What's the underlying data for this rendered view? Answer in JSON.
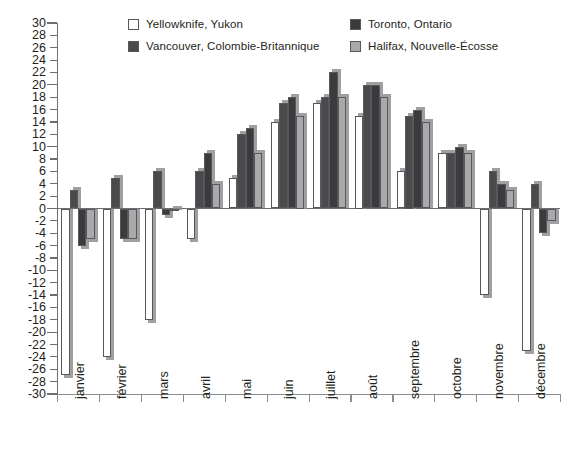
{
  "chart_data": {
    "type": "bar",
    "title": "",
    "subtitle": "",
    "xlabel": "",
    "ylabel": "",
    "ylim": [
      -30,
      30
    ],
    "ytick_step": 2,
    "grid": false,
    "legend_position": "top",
    "categories": [
      "janvier",
      "février",
      "mars",
      "avril",
      "mai",
      "juin",
      "juillet",
      "août",
      "septembre",
      "octobre",
      "novembre",
      "décembre"
    ],
    "ytick_labels": [
      "30",
      "28",
      "26",
      "24",
      "22",
      "20",
      "18",
      "16",
      "14",
      "12",
      "10",
      "8",
      "6",
      "4",
      "2",
      "0",
      "-2",
      "-4",
      "-6",
      "-8",
      "-10",
      "-12",
      "-14",
      "-16",
      "-18",
      "-20",
      "-22",
      "-24",
      "-26",
      "-28",
      "-30"
    ],
    "series": [
      {
        "name": "Yellowknife, Yukon",
        "color": "#ffffff",
        "values": [
          -27,
          -24,
          -18,
          -5,
          5,
          14,
          17,
          15,
          6,
          9,
          -14,
          -23
        ]
      },
      {
        "name": "Vancouver, Colombie-Britannique",
        "color": "#4a4a4c",
        "values": [
          3,
          5,
          6,
          6,
          12,
          17,
          18,
          20,
          15,
          9,
          6,
          4
        ]
      },
      {
        "name": "Toronto, Ontario",
        "color": "#3b3b3d",
        "values": [
          -6,
          -5,
          -1,
          9,
          13,
          18,
          22,
          20,
          16,
          10,
          4,
          -4
        ]
      },
      {
        "name": "Halifax, Nouvelle-Écosse",
        "color": "#a9a9ab",
        "values": [
          -5,
          -5,
          0,
          4,
          9,
          15,
          18,
          18,
          14,
          9,
          3,
          -2
        ]
      }
    ]
  },
  "legend": {
    "items": [
      {
        "label": "Yellowknife, Yukon",
        "color": "#ffffff",
        "col": 1,
        "row": 1
      },
      {
        "label": "Vancouver, Colombie-Britannique",
        "color": "#4a4a4c",
        "col": 1,
        "row": 2
      },
      {
        "label": "Toronto, Ontario",
        "color": "#3b3b3d",
        "col": 2,
        "row": 1
      },
      {
        "label": "Halifax, Nouvelle-Écosse",
        "color": "#a9a9ab",
        "col": 2,
        "row": 2
      }
    ]
  }
}
